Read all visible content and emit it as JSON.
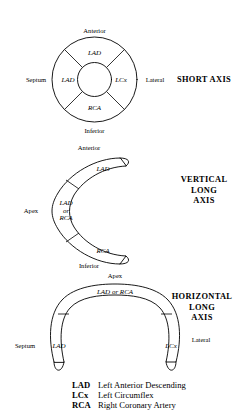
{
  "figure": {
    "kind": "coronary-artery-territory-diagram",
    "background_color": "#ffffff",
    "line_color": "#000000"
  },
  "panels": [
    {
      "id": "short-axis",
      "title": "SHORT AXIS",
      "title_lines": [
        "SHORT AXIS"
      ],
      "shape": "annulus-donut",
      "segments": [
        {
          "position": "anterior",
          "label": "LAD"
        },
        {
          "position": "septal",
          "label": "LAD"
        },
        {
          "position": "lateral",
          "label": "LCx"
        },
        {
          "position": "inferior",
          "label": "RCA"
        }
      ],
      "orientation_labels": {
        "top": "Anterior",
        "bottom": "Inferior",
        "left": "Septum",
        "right": "Lateral"
      }
    },
    {
      "id": "vertical-long-axis",
      "title": "VERTICAL LONG AXIS",
      "title_lines": [
        "VERTICAL",
        "LONG",
        "AXIS"
      ],
      "shape": "c-shape-open-right",
      "segments": [
        {
          "position": "anterior-arm",
          "label": "LAD"
        },
        {
          "position": "apex",
          "label_lines": [
            "LAD",
            "or",
            "RCA"
          ]
        },
        {
          "position": "inferior-arm",
          "label": "RCA"
        }
      ],
      "orientation_labels": {
        "top": "Anterior",
        "bottom": "Inferior",
        "left": "Apex"
      }
    },
    {
      "id": "horizontal-long-axis",
      "title": "HORIZONTAL LONG AXIS",
      "title_lines": [
        "HORIZONTAL",
        "LONG",
        "AXIS"
      ],
      "shape": "u-shape-open-down",
      "segments": [
        {
          "position": "septal-arm",
          "label": "LAD"
        },
        {
          "position": "apex",
          "label": "LAD or RCA"
        },
        {
          "position": "lateral-arm",
          "label": "LCx"
        }
      ],
      "orientation_labels": {
        "top": "Apex",
        "left": "Septum",
        "right": "Lateral"
      }
    }
  ],
  "legend": {
    "entries": [
      {
        "abbr": "LAD",
        "description": "Left Anterior Descending"
      },
      {
        "abbr": "LCx",
        "description": "Left Circumflex"
      },
      {
        "abbr": "RCA",
        "description": "Right Coronary Artery"
      }
    ]
  }
}
